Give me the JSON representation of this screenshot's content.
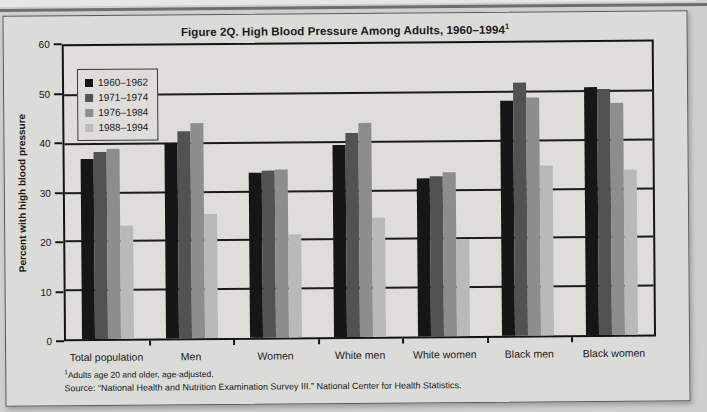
{
  "figure": {
    "title": "Figure 2Q. High Blood Pressure Among Adults, 1960–1994",
    "title_superscript": "1",
    "footnote_superscript": "1",
    "footnote": "Adults age 20 and older, age-adjusted.",
    "source": "Source: “National Health and Nutrition Examination Survey III.” National Center for Health Statistics."
  },
  "chart_data": {
    "type": "bar",
    "title": "Figure 2Q. High Blood Pressure Among Adults, 1960–1994",
    "xlabel": "",
    "ylabel": "Percent with high blood pressure",
    "ylim": [
      0,
      60
    ],
    "yticks": [
      0,
      10,
      20,
      30,
      40,
      50,
      60
    ],
    "grid": true,
    "legend_position": "top-left-inside",
    "categories": [
      "Total population",
      "Men",
      "Women",
      "White men",
      "White women",
      "Black men",
      "Black women"
    ],
    "series": [
      {
        "name": "1960–1962",
        "color": "#161616",
        "values": [
          36.9,
          40.0,
          33.7,
          39.3,
          32.4,
          48.1,
          50.8
        ]
      },
      {
        "name": "1971–1974",
        "color": "#525250",
        "values": [
          38.3,
          42.4,
          34.3,
          41.7,
          32.8,
          51.8,
          50.3
        ]
      },
      {
        "name": "1976–1984",
        "color": "#8d8d8b",
        "values": [
          39.0,
          44.0,
          34.4,
          43.9,
          33.5,
          48.7,
          47.6
        ]
      },
      {
        "name": "1988–1994",
        "color": "#b9b9b7",
        "values": [
          23.1,
          25.3,
          21.0,
          24.4,
          19.9,
          34.9,
          33.8
        ]
      }
    ]
  },
  "colors": {
    "page_bg": "#cfcfcb",
    "figure_bg": "#dbdbd7",
    "plot_bg": "#deddda",
    "line": "#141414"
  }
}
